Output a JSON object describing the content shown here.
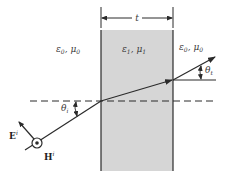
{
  "diagram": {
    "type": "slab-refraction",
    "colors": {
      "slab_fill": "#d6d6d6",
      "line": "#2b2b2b",
      "background": "#ffffff"
    },
    "labels": {
      "thickness": "t",
      "left_medium_eps": "ε",
      "left_medium_eps_sub": "0",
      "left_medium_sep": ", ",
      "left_medium_mu": "μ",
      "left_medium_mu_sub": "0",
      "slab_medium_eps": "ε",
      "slab_medium_eps_sub": "1",
      "slab_medium_sep": ", ",
      "slab_medium_mu": "μ",
      "slab_medium_mu_sub": "1",
      "right_medium_eps": "ε",
      "right_medium_eps_sub": "0",
      "right_medium_sep": ", ",
      "right_medium_mu": "μ",
      "right_medium_mu_sub": "0",
      "incident_angle": "θ",
      "incident_angle_sub": "i",
      "transmitted_angle": "θ",
      "transmitted_angle_sub": "t",
      "e_field": "E",
      "e_field_sup": "i",
      "h_field": "H",
      "h_field_sup": "i"
    }
  }
}
